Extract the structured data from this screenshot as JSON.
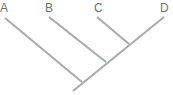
{
  "diagram": {
    "type": "cladogram",
    "taxa": [
      {
        "label": "A"
      },
      {
        "label": "B"
      },
      {
        "label": "C"
      },
      {
        "label": "D"
      }
    ],
    "line_color": "#a7a9ac",
    "label_color": "#6d6e70"
  }
}
